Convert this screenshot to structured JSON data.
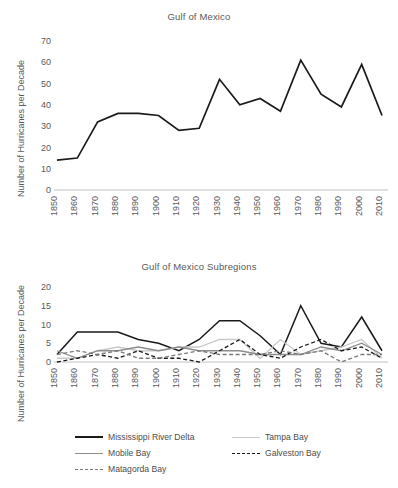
{
  "figure": {
    "ylabel": "Number of Hurricanes per Decade"
  },
  "panels": {
    "top": {
      "title": "Gulf of Mexico"
    },
    "bottom": {
      "title": "Gulf of Mexico Subregions"
    }
  },
  "legend": {
    "items": [
      {
        "key": "mississippi_river_delta",
        "label": "Mississippi River Delta",
        "style": "solid-black-thick",
        "color": "#1a1a1a"
      },
      {
        "key": "tampa_bay",
        "label": "Tampa Bay",
        "style": "solid-light-gray",
        "color": "#c9c9c9"
      },
      {
        "key": "mobile_bay",
        "label": "Mobile Bay",
        "style": "solid-gray",
        "color": "#8c8c8c"
      },
      {
        "key": "galveston_bay",
        "label": "Galveston Bay",
        "style": "dashed-black",
        "color": "#1a1a1a"
      },
      {
        "key": "matagorda_bay",
        "label": "Matagorda Bay",
        "style": "dashed-gray",
        "color": "#7a7a7a"
      }
    ]
  },
  "footer_text": "",
  "chart_data": [
    {
      "id": "gulf-of-mexico",
      "type": "line",
      "title": "Gulf of Mexico",
      "xlabel": "",
      "ylabel": "Number of Hurricanes per Decade",
      "categories": [
        "1850",
        "1860",
        "1870",
        "1880",
        "1890",
        "1900",
        "1910",
        "1920",
        "1930",
        "1940",
        "1950",
        "1960",
        "1970",
        "1980",
        "1990",
        "2000",
        "2010"
      ],
      "ylim": [
        0,
        70
      ],
      "yticks": [
        0,
        10,
        20,
        30,
        40,
        50,
        60,
        70
      ],
      "grid": false,
      "legend_position": "none",
      "series": [
        {
          "name": "Gulf of Mexico",
          "color": "#1a1a1a",
          "values": [
            14,
            15,
            32,
            36,
            36,
            35,
            28,
            29,
            52,
            40,
            43,
            37,
            61,
            45,
            39,
            59,
            35
          ]
        }
      ]
    },
    {
      "id": "gulf-of-mexico-subregions",
      "type": "line",
      "title": "Gulf of Mexico Subregions",
      "xlabel": "",
      "ylabel": "Number of Hurricanes per Decade",
      "categories": [
        "1850",
        "1860",
        "1870",
        "1880",
        "1890",
        "1900",
        "1910",
        "1920",
        "1930",
        "1940",
        "1950",
        "1960",
        "1970",
        "1980",
        "1990",
        "2000",
        "2010"
      ],
      "ylim": [
        0,
        20
      ],
      "yticks": [
        0,
        5,
        10,
        15,
        20
      ],
      "grid": false,
      "legend_position": "bottom",
      "series": [
        {
          "name": "Mississippi River Delta",
          "color": "#1a1a1a",
          "style": "solid",
          "values": [
            2,
            8,
            8,
            8,
            6,
            5,
            3,
            6,
            11,
            11,
            7,
            2,
            15,
            5,
            4,
            12,
            3
          ]
        },
        {
          "name": "Tampa Bay",
          "color": "#c9c9c9",
          "style": "solid",
          "values": [
            1,
            1,
            3,
            4,
            3,
            3,
            4,
            4,
            6,
            6,
            1,
            6,
            2,
            3,
            4,
            6,
            1
          ]
        },
        {
          "name": "Mobile Bay",
          "color": "#8c8c8c",
          "style": "solid",
          "values": [
            3,
            1,
            3,
            3,
            4,
            3,
            4,
            3,
            3,
            3,
            2,
            2,
            2,
            4,
            3,
            5,
            2
          ]
        },
        {
          "name": "Galveston Bay",
          "color": "#1a1a1a",
          "style": "dashed",
          "values": [
            0,
            1,
            2,
            1,
            3,
            1,
            1,
            0,
            3,
            6,
            2,
            1,
            4,
            6,
            3,
            4,
            1
          ]
        },
        {
          "name": "Matagorda Bay",
          "color": "#7a7a7a",
          "style": "dashed",
          "values": [
            2,
            3,
            2,
            3,
            1,
            1,
            2,
            3,
            2,
            2,
            2,
            3,
            2,
            3,
            0,
            2,
            2
          ]
        }
      ]
    }
  ]
}
